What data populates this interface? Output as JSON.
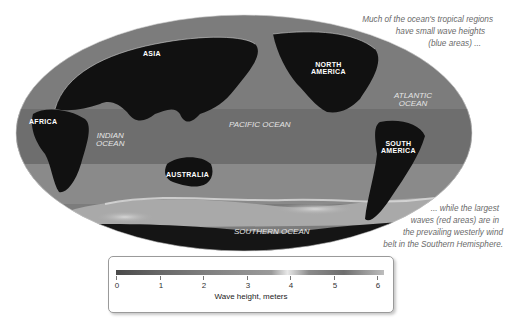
{
  "map": {
    "projection": "ellipse (Mollweide-style)",
    "continents": {
      "asia": "ASIA",
      "africa": "AFRICA",
      "north_america": "NORTH AMERICA",
      "north_america_l1": "NORTH",
      "north_america_l2": "AMERICA",
      "south_america_l1": "SOUTH",
      "south_america_l2": "AMERICA",
      "australia": "AUSTRALIA"
    },
    "oceans": {
      "indian_l1": "INDIAN",
      "indian_l2": "OCEAN",
      "pacific": "PACIFIC OCEAN",
      "atlantic_l1": "ATLANTIC",
      "atlantic_l2": "OCEAN",
      "southern": "SOUTHERN OCEAN"
    },
    "colors": {
      "land": "#111111",
      "ocean_low": "#6a6a6a",
      "ocean_mid": "#8a8a8a",
      "ocean_high": "#c9c9c9",
      "coast": "#d8d8d8"
    }
  },
  "captions": {
    "top": {
      "line1": "Much of the ocean's tropical regions",
      "line2": "have small wave heights",
      "line3": "(blue areas) ..."
    },
    "bottom": {
      "line1": "... while the largest",
      "line2": "waves (red areas) are in",
      "line3": "the prevailing westerly wind",
      "line4": "belt in the Southern Hemisphere."
    }
  },
  "legend": {
    "title": "Wave height, meters",
    "ticks": [
      "0",
      "1",
      "2",
      "3",
      "4",
      "5",
      "6"
    ],
    "range": [
      0,
      6
    ]
  }
}
